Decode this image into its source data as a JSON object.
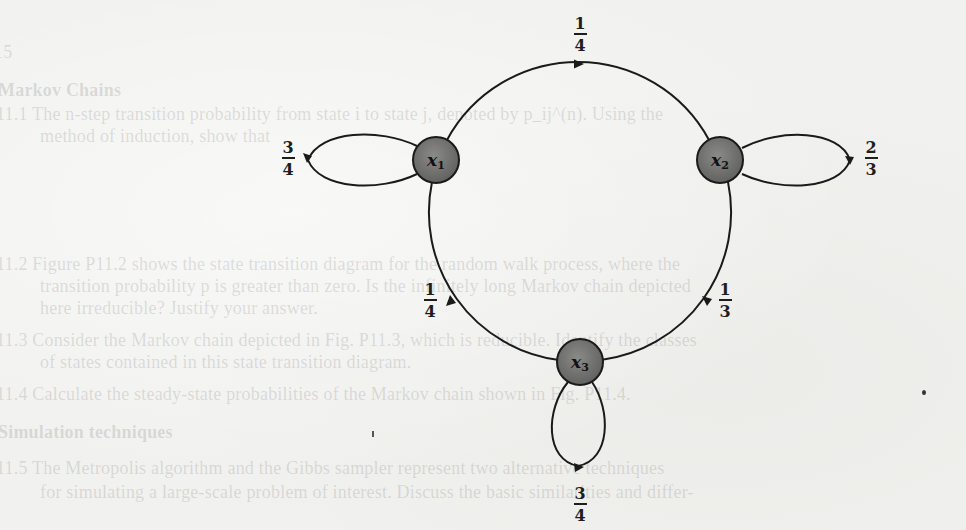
{
  "figure": {
    "type": "state-transition-diagram",
    "nodes": [
      {
        "id": "x1",
        "label": "x",
        "subscript": "1"
      },
      {
        "id": "x2",
        "label": "x",
        "subscript": "2"
      },
      {
        "id": "x3",
        "label": "x",
        "subscript": "3"
      }
    ],
    "edges": [
      {
        "from": "x1",
        "to": "x1",
        "prob_num": "3",
        "prob_den": "4",
        "kind": "self-loop"
      },
      {
        "from": "x2",
        "to": "x2",
        "prob_num": "2",
        "prob_den": "3",
        "kind": "self-loop"
      },
      {
        "from": "x3",
        "to": "x3",
        "prob_num": "3",
        "prob_den": "4",
        "kind": "self-loop"
      },
      {
        "from": "x1",
        "to": "x2",
        "prob_num": "1",
        "prob_den": "4",
        "kind": "arc"
      },
      {
        "from": "x2",
        "to": "x3",
        "prob_num": "1",
        "prob_den": "3",
        "kind": "arc"
      },
      {
        "from": "x3",
        "to": "x1",
        "prob_num": "1",
        "prob_den": "4",
        "kind": "arc"
      }
    ],
    "colors": {
      "node_fill": "#6e6e6e",
      "stroke": "#1a1a1a",
      "paper": "#f1f1ef"
    }
  },
  "bleed_through_text": [
    "15",
    "Markov Chains",
    "11.1  The n-step transition probability from state i to state j, denoted by p_ij^(n). Using the",
    "method of induction, show that",
    "11.2  Figure P11.2 shows the state transition diagram for the random walk process, where the",
    "transition probability p is greater than zero. Is the infinitely long Markov chain depicted",
    "here irreducible? Justify your answer.",
    "11.3  Consider the Markov chain depicted in Fig. P11.3, which is reducible. Identify the classes",
    "of states contained in this state transition diagram.",
    "11.4  Calculate the steady-state probabilities of the Markov chain shown in Fig. P11.4.",
    "Simulation techniques",
    "11.5  The Metropolis algorithm and the Gibbs sampler represent two alternative techniques",
    "for simulating a large-scale problem of interest. Discuss the basic similarities and differ-"
  ]
}
